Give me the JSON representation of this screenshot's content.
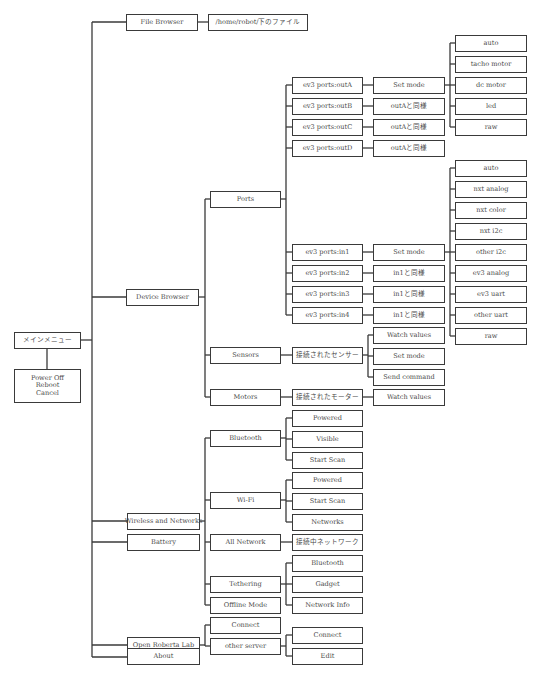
{
  "diagram": {
    "root": {
      "label": "メインメニュー"
    },
    "root_sub": {
      "label": "Power Off\nReboot\nCancel"
    },
    "level1": [
      {
        "key": "file_browser",
        "label": "File Browser"
      },
      {
        "key": "device_browser",
        "label": "Device Browser"
      },
      {
        "key": "wireless",
        "label": "Wireless and Networks"
      },
      {
        "key": "battery",
        "label": "Battery"
      },
      {
        "key": "open_roberta",
        "label": "Open Roberta Lab"
      },
      {
        "key": "about",
        "label": "About"
      }
    ],
    "file_browser": {
      "path_label": "/home/robot/下のファイル"
    },
    "device_browser": {
      "ports": {
        "label": "Ports",
        "out_ports": [
          {
            "label": "ev3 ports:outA",
            "action": "Set mode"
          },
          {
            "label": "ev3 ports:outB",
            "action": "outAと同様"
          },
          {
            "label": "ev3 ports:outC",
            "action": "outAと同様"
          },
          {
            "label": "ev3 ports:outD",
            "action": "outAと同様"
          }
        ],
        "out_modes": [
          "auto",
          "tacho motor",
          "dc motor",
          "led",
          "raw"
        ],
        "in_ports": [
          {
            "label": "ev3 ports:in1",
            "action": "Set mode"
          },
          {
            "label": "ev3 ports:in2",
            "action": "in1と同様"
          },
          {
            "label": "ev3 ports:in3",
            "action": "in1と同様"
          },
          {
            "label": "ev3 ports:in4",
            "action": "in1と同様"
          }
        ],
        "in_modes": [
          "auto",
          "nxt analog",
          "nxt color",
          "nxt i2c",
          "other i2c",
          "ev3 analog",
          "ev3 uart",
          "other uart",
          "raw"
        ]
      },
      "sensors": {
        "label": "Sensors",
        "connected": "接続されたセンサー",
        "actions": [
          "Watch values",
          "Set mode",
          "Send command"
        ]
      },
      "motors": {
        "label": "Motors",
        "connected": "接続されたモーター",
        "actions": [
          "Watch values"
        ]
      }
    },
    "wireless": {
      "bluetooth": {
        "label": "Bluetooth",
        "items": [
          "Powered",
          "Visible",
          "Start Scan"
        ]
      },
      "wifi": {
        "label": "Wi-Fi",
        "items": [
          "Powered",
          "Start Scan",
          "Networks"
        ]
      },
      "all_network": {
        "label": "All Network",
        "items": [
          "接続中ネットワーク"
        ]
      },
      "tethering": {
        "label": "Tethering",
        "items": [
          "Bluetooth",
          "Gadget",
          "Network Info"
        ]
      },
      "offline": {
        "label": "Offline Mode"
      }
    },
    "open_roberta": {
      "connect": "Connect",
      "other_server": {
        "label": "other server",
        "items": [
          "Connect",
          "Edit"
        ]
      }
    }
  },
  "colors": {
    "line": "#3a3a3a",
    "text": "#4a4a4a",
    "background": "#ffffff"
  }
}
